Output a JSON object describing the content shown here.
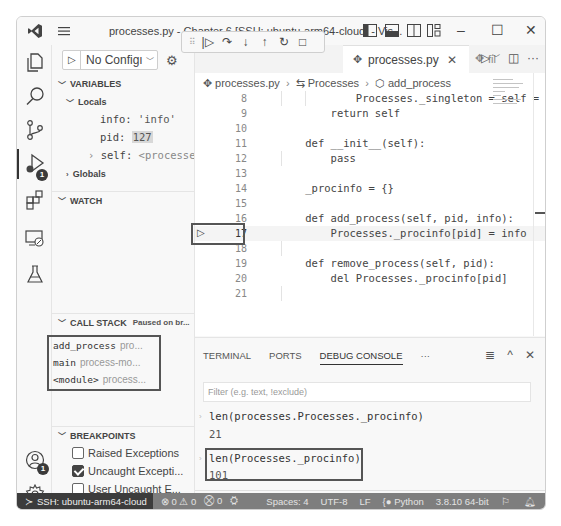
{
  "titlebar": {
    "title": "processes.py - Chapter 6 [SSH: ubuntu-arm64-cloud] - Vis...",
    "controls": {
      "minimize": "–",
      "maximize": "☐",
      "close": "✕"
    }
  },
  "activity_bar": {
    "items": [
      {
        "name": "explorer-icon"
      },
      {
        "name": "search-icon"
      },
      {
        "name": "source-control-icon"
      },
      {
        "name": "run-debug-icon",
        "badge": "1",
        "active": true
      },
      {
        "name": "extensions-icon"
      },
      {
        "name": "remote-explorer-icon"
      },
      {
        "name": "testing-icon"
      }
    ],
    "bottom": [
      {
        "name": "accounts-icon",
        "badge": "1"
      },
      {
        "name": "manage-gear-icon"
      }
    ]
  },
  "debug_sidebar": {
    "config_label": "No Configı",
    "sections": {
      "variables": "VARIABLES",
      "watch": "WATCH",
      "call_stack": "CALL STACK",
      "call_stack_status": "Paused on br...",
      "breakpoints": "BREAKPOINTS"
    },
    "locals_label": "Locals",
    "globals_label": "Globals",
    "variables": [
      {
        "name": "info",
        "value": "'info'"
      },
      {
        "name": "pid",
        "value": "127"
      },
      {
        "name": "self",
        "value": "<processes.P..."
      }
    ],
    "call_stack": [
      {
        "fn": "add_process",
        "file": "pro..."
      },
      {
        "fn": "main",
        "file": "process-mo..."
      },
      {
        "fn": "<module>",
        "file": "process..."
      }
    ],
    "breakpoints": [
      {
        "label": "Raised Exceptions",
        "checked": false
      },
      {
        "label": "Uncaught Excepti...",
        "checked": true
      },
      {
        "label": "User Uncaught E...",
        "checked": false
      },
      {
        "label": "processes.py",
        "checked": true,
        "line": "17"
      }
    ]
  },
  "debug_toolbar": {
    "buttons": [
      "continue",
      "step-over",
      "step-into",
      "step-out",
      "restart",
      "stop"
    ],
    "glyphs": {
      "grip": "⠿",
      "continue": "|▷",
      "step_over": "↷",
      "step_into": "↓",
      "step_out": "↑",
      "restart": "↻",
      "stop": "□"
    }
  },
  "tabs": {
    "active": "processes.py",
    "second": "fil",
    "close_glyph": "✕"
  },
  "editor": {
    "breadcrumb": [
      "processes.py",
      "Processes",
      "add_process"
    ],
    "current_line": 17,
    "lines": [
      {
        "n": "8",
        "text": "            Processes._singleton = self = s"
      },
      {
        "n": "9",
        "text": "        return self"
      },
      {
        "n": "10",
        "text": ""
      },
      {
        "n": "11",
        "text": "    def __init__(self):"
      },
      {
        "n": "12",
        "text": "        pass"
      },
      {
        "n": "13",
        "text": ""
      },
      {
        "n": "14",
        "text": "    _procinfo = {}"
      },
      {
        "n": "15",
        "text": ""
      },
      {
        "n": "16",
        "text": "    def add_process(self, pid, info):"
      },
      {
        "n": "17",
        "text": "        Processes._procinfo[pid] = info"
      },
      {
        "n": "18",
        "text": ""
      },
      {
        "n": "19",
        "text": "    def remove_process(self, pid):"
      },
      {
        "n": "20",
        "text": "        del Processes._procinfo[pid]"
      },
      {
        "n": "21",
        "text": ""
      }
    ]
  },
  "panel": {
    "tabs": [
      "TERMINAL",
      "PORTS",
      "DEBUG CONSOLE"
    ],
    "active_tab": "DEBUG CONSOLE",
    "more": "···",
    "filter_placeholder": "Filter (e.g. text, !exclude)",
    "console": [
      {
        "input": "len(processes.Processes._procinfo)",
        "output": "21"
      },
      {
        "input": "len(Processes._procinfo)",
        "output": "101"
      }
    ],
    "prompt": ">"
  },
  "statusbar": {
    "remote": "SSH: ubuntu-arm64-cloud",
    "errors": "0",
    "warnings": "0",
    "ports": "0",
    "spaces": "Spaces: 4",
    "encoding": "UTF-8",
    "eol": "LF",
    "language": "Python",
    "interpreter": "3.8.10 64-bit"
  }
}
